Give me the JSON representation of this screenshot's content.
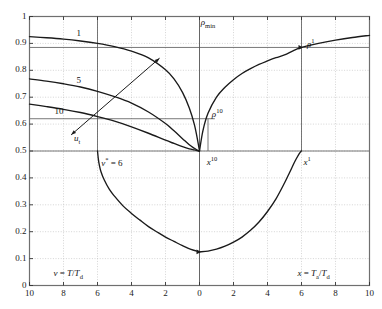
{
  "figure": {
    "background": "#ffffff",
    "frame_color": "#6f6f6f",
    "grid_color": "#b9b9b9",
    "curve_color": "#1a1a1a",
    "refline_color": "#555555"
  },
  "chart_data": {
    "type": "line",
    "title": "",
    "subtitle": "",
    "xlabel_left": "v = T/T_d",
    "xlabel_right": "x = T_a/T_d",
    "ylabel": "",
    "grid": true,
    "legend_position": "inline-curve-labels",
    "axes": {
      "x_left_range": [
        10,
        0
      ],
      "x_right_range": [
        0,
        10
      ],
      "x_ticks_left": [
        10,
        8,
        6,
        4,
        2
      ],
      "x_ticks_right": [
        0,
        2,
        4,
        6,
        8,
        10
      ],
      "x_tick_labels": [
        "10",
        "8",
        "6",
        "4",
        "2",
        "0",
        "2",
        "4",
        "6",
        "8",
        "10"
      ],
      "y_range": [
        0,
        1
      ],
      "y_ticks": [
        0,
        0.1,
        0.2,
        0.3,
        0.4,
        0.5,
        0.6,
        0.7,
        0.8,
        0.9,
        1
      ],
      "y_tick_labels": [
        "0",
        "0.1",
        "0.2",
        "0.3",
        "0.4",
        "0.5",
        "0.6",
        "0.7",
        "0.8",
        "0.9",
        "1"
      ]
    },
    "reference_lines": {
      "vertical_center_x": 0,
      "horizontal": [
        {
          "y": 0.885,
          "label": "rho-1-level"
        },
        {
          "y": 0.62,
          "label": "rho-10-level"
        },
        {
          "y": 0.5,
          "label": "half-level"
        }
      ],
      "verticals": [
        {
          "x_side": "left",
          "x": 6,
          "label": "v-star-6"
        },
        {
          "x_side": "right",
          "x": 6,
          "label": "x-1"
        },
        {
          "x_side": "right",
          "x": 0.5,
          "label": "x-10-box"
        }
      ]
    },
    "series": [
      {
        "name": "1",
        "side": "left",
        "comment": "upper branch curve labelled 1, descends from 0.925 at v=10 to 0.50 at v=0",
        "x": [
          10,
          9,
          8,
          7,
          6,
          5,
          4,
          3,
          2,
          1.5,
          1,
          0.6,
          0.3,
          0.1,
          0
        ],
        "y": [
          0.925,
          0.921,
          0.916,
          0.909,
          0.9,
          0.888,
          0.871,
          0.846,
          0.802,
          0.768,
          0.718,
          0.66,
          0.598,
          0.536,
          0.5
        ]
      },
      {
        "name": "5",
        "side": "left",
        "comment": "middle curve labelled 5",
        "x": [
          10,
          9,
          8,
          7,
          6,
          5,
          4,
          3,
          2,
          1.5,
          1,
          0.6,
          0.3,
          0.1,
          0
        ],
        "y": [
          0.768,
          0.76,
          0.75,
          0.738,
          0.722,
          0.702,
          0.678,
          0.645,
          0.602,
          0.575,
          0.546,
          0.523,
          0.51,
          0.502,
          0.5
        ]
      },
      {
        "name": "10",
        "side": "left",
        "comment": "lower curve labelled 10",
        "x": [
          10,
          9,
          8,
          7,
          6,
          5,
          4,
          3,
          2,
          1.5,
          1,
          0.6,
          0.3,
          0.1,
          0
        ],
        "y": [
          0.674,
          0.665,
          0.655,
          0.643,
          0.628,
          0.611,
          0.59,
          0.566,
          0.54,
          0.528,
          0.516,
          0.508,
          0.504,
          0.501,
          0.5
        ]
      },
      {
        "name": "rho",
        "side": "right",
        "comment": "rising rho curve on right side from 0.50 at x=0 to 0.93 at x=10, passes rho^1 at x=6",
        "x": [
          0,
          0.2,
          0.5,
          1,
          1.5,
          2,
          2.5,
          3,
          3.5,
          4,
          4.5,
          5,
          5.5,
          6,
          7,
          8,
          9,
          10
        ],
        "y": [
          0.5,
          0.575,
          0.64,
          0.7,
          0.737,
          0.765,
          0.788,
          0.806,
          0.822,
          0.835,
          0.847,
          0.857,
          0.872,
          0.885,
          0.9,
          0.912,
          0.922,
          0.93
        ]
      },
      {
        "name": "u-branch-left",
        "side": "left",
        "comment": "steep descending branch from 0.50 at v=6 down and right toward minimum",
        "x": [
          6,
          5.95,
          5.9,
          5.8,
          5.6,
          5.3,
          5,
          4.5,
          4,
          3.5,
          3,
          2.5,
          2,
          1.5,
          1,
          0.5,
          0
        ],
        "y": [
          0.5,
          0.47,
          0.45,
          0.424,
          0.392,
          0.357,
          0.332,
          0.296,
          0.268,
          0.243,
          0.219,
          0.199,
          0.18,
          0.164,
          0.148,
          0.134,
          0.125
        ]
      },
      {
        "name": "u-branch-right",
        "side": "right",
        "comment": "rising branch from minimum back up to 0.50 at x=6",
        "x": [
          0,
          0.5,
          1,
          1.5,
          2,
          2.5,
          3,
          3.5,
          4,
          4.5,
          5,
          5.3,
          5.6,
          5.8,
          5.9,
          5.95,
          6
        ],
        "y": [
          0.125,
          0.128,
          0.135,
          0.146,
          0.161,
          0.18,
          0.205,
          0.236,
          0.275,
          0.322,
          0.381,
          0.42,
          0.46,
          0.483,
          0.493,
          0.497,
          0.5
        ]
      }
    ],
    "curve_labels": [
      {
        "text": "1",
        "side": "left",
        "x": 7.0,
        "y": 0.935
      },
      {
        "text": "5",
        "side": "left",
        "x": 7.0,
        "y": 0.76
      },
      {
        "text": "10",
        "side": "left",
        "x": 8.3,
        "y": 0.645
      }
    ],
    "annotations": [
      {
        "name": "rho-min-label",
        "text": "ρ",
        "sub": "min",
        "side": "right",
        "x": 0.25,
        "y": 0.975
      },
      {
        "name": "rho-1-label",
        "text": "ρ",
        "sup": "1",
        "side": "right",
        "x": 6.5,
        "y": 0.905
      },
      {
        "name": "rho-10-label",
        "text": "ρ",
        "sup": "10",
        "side": "right",
        "x": 0.9,
        "y": 0.645
      },
      {
        "name": "x-10-label",
        "text": "x",
        "sup": "10",
        "side": "right",
        "x": 0.6,
        "y": 0.465
      },
      {
        "name": "x-1-label",
        "text": "x",
        "sup": "1",
        "side": "right",
        "x": 6.3,
        "y": 0.465
      },
      {
        "name": "v-star-label",
        "text": "v",
        "sup": "*",
        "extra": " = 6",
        "side": "left",
        "x": 5.6,
        "y": 0.462
      },
      {
        "name": "u-t-label",
        "text": "u",
        "sub": "t",
        "side": "left",
        "x": 7.2,
        "y": 0.545
      }
    ],
    "arrow": {
      "name": "u-t-arrow",
      "comment": "double-headed diagonal arrow pointing from lower-left (u_t label) to upper-right onto curve 1",
      "from": {
        "side": "left",
        "x": 7.55,
        "y": 0.56
      },
      "to": {
        "side": "left",
        "x": 2.35,
        "y": 0.845
      }
    },
    "tick_marker_arrows": [
      {
        "name": "marker-rho-1",
        "side": "right",
        "x": 6.0,
        "y": 0.885
      },
      {
        "name": "marker-u-min",
        "side": "right",
        "x": 0.0,
        "y": 0.125
      }
    ]
  },
  "axis_titles": {
    "left": {
      "v": "v",
      "eq": " = ",
      "num": "T",
      "slash": "/",
      "den": "T",
      "den_sub": "d"
    },
    "right": {
      "x": "x",
      "eq": " = ",
      "num": "T",
      "num_sub": "a",
      "slash": "/",
      "den": "T",
      "den_sub": "d"
    }
  }
}
